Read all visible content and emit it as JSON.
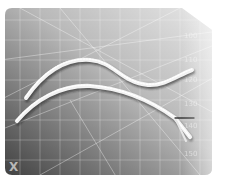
{
  "image": {
    "description": "Two pale worm-like strands lying on a gray grid cutting mat",
    "corner_mark": "X",
    "scale_labels": [
      "100",
      "110",
      "120",
      "130",
      "140",
      "150",
      "160"
    ],
    "colors": {
      "mat_light": "#e6e6e6",
      "mat_dark": "#3c3c3c",
      "grid_line": "#ffffff",
      "strand": "#f0f0f0",
      "strand_shadow": "#2a2a2a"
    }
  }
}
